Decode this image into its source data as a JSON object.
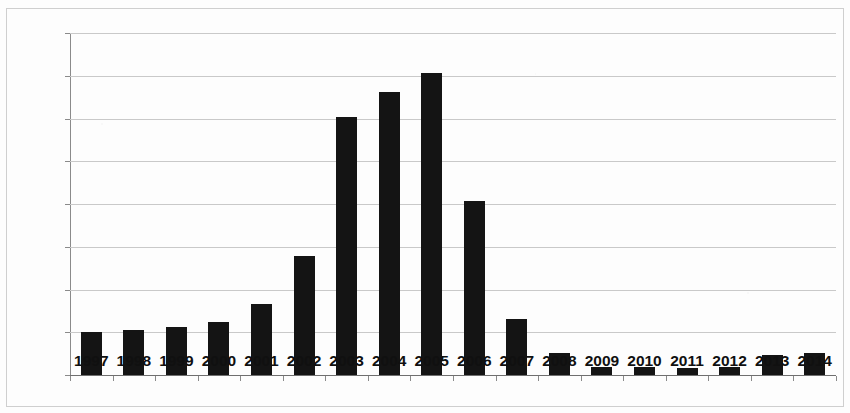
{
  "chart_data": {
    "type": "bar",
    "title": "",
    "xlabel": "",
    "ylabel": "",
    "ylim": [
      0,
      8000
    ],
    "ytick_step": 1000,
    "grid": true,
    "legend": false,
    "bar_color": "#141414",
    "gridline_color": "#c9c9c9",
    "axis_color": "#8a8a8a",
    "categories": [
      "1997",
      "1998",
      "1999",
      "2000",
      "2001",
      "2002",
      "2003",
      "2004",
      "2005",
      "2006",
      "2007",
      "2008",
      "2009",
      "2010",
      "2011",
      "2012",
      "2013",
      "2014"
    ],
    "values": [
      1010,
      1050,
      1130,
      1250,
      1650,
      2780,
      6030,
      6620,
      7060,
      4060,
      1300,
      520,
      180,
      190,
      170,
      180,
      460,
      520
    ],
    "ytick_labels": [
      "0",
      "1,000",
      "2,000",
      "3,000",
      "4,000",
      "5,000",
      "6,000",
      "7,000",
      "8,000"
    ],
    "ytick_values": [
      0,
      1000,
      2000,
      3000,
      4000,
      5000,
      6000,
      7000,
      8000
    ]
  }
}
